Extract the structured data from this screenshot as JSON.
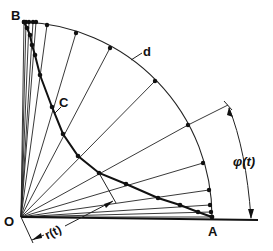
{
  "diagram": {
    "type": "geometric-construction",
    "labels": {
      "origin": "O",
      "point_a": "A",
      "point_b": "B",
      "curve": "C",
      "arc": "d",
      "radius": "r(t)",
      "angle": "φ(t)"
    },
    "colors": {
      "ink": "#111111",
      "background": "#ffffff"
    },
    "origin_xy": [
      21,
      217
    ],
    "arc_points": [
      [
        24,
        22
      ],
      [
        26,
        22
      ],
      [
        29,
        22
      ],
      [
        33,
        22
      ],
      [
        36,
        22
      ],
      [
        47,
        25
      ],
      [
        76,
        33
      ],
      [
        110,
        48
      ],
      [
        155,
        81
      ],
      [
        188,
        125
      ],
      [
        203,
        163
      ],
      [
        209,
        190
      ],
      [
        210,
        205
      ],
      [
        211,
        212
      ],
      [
        212,
        217
      ]
    ],
    "curve_points": [
      [
        24,
        22
      ],
      [
        27,
        28
      ],
      [
        30,
        35
      ],
      [
        32,
        45
      ],
      [
        35,
        55
      ],
      [
        40,
        75
      ],
      [
        52,
        107
      ],
      [
        63,
        134
      ],
      [
        78,
        156
      ],
      [
        99,
        173
      ],
      [
        126,
        184
      ],
      [
        158,
        198
      ],
      [
        180,
        205
      ],
      [
        198,
        212
      ],
      [
        212,
        217
      ]
    ]
  }
}
